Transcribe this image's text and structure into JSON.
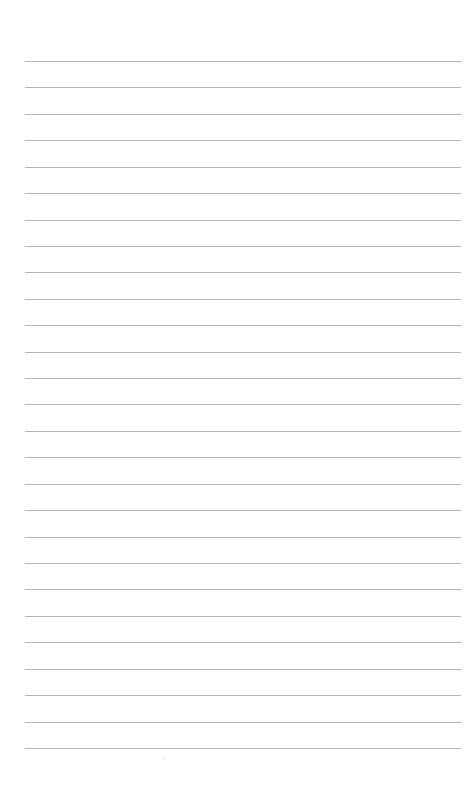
{
  "page": {
    "type": "lined-paper",
    "background_color": "#ffffff",
    "line_color": "#b4b4b4",
    "line_count": 27,
    "first_line_y": 61,
    "line_spacing": 26.42,
    "line_left": 25,
    "line_right": 461,
    "text": ""
  }
}
